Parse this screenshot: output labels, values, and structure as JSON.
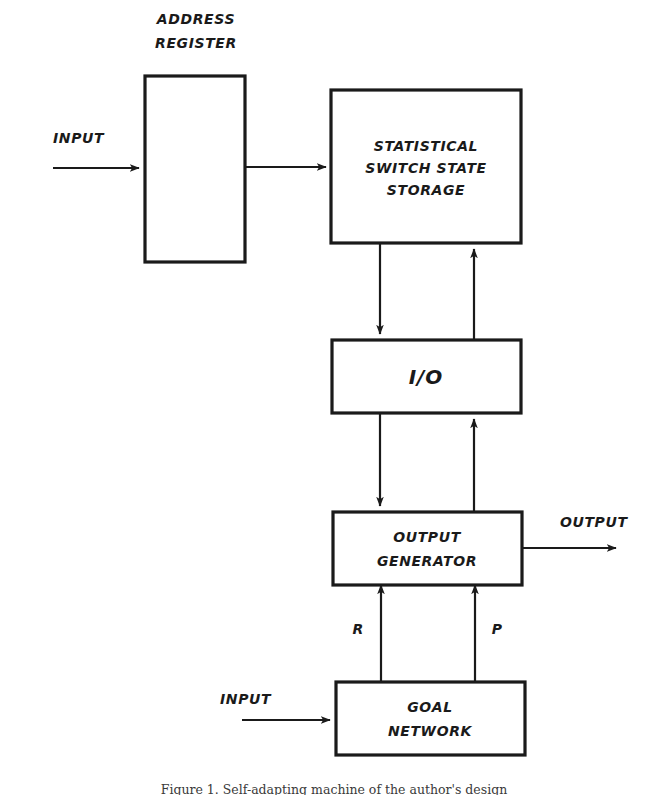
{
  "figure": {
    "type": "block-diagram",
    "background_color": "#ffffff",
    "line_color": "#1a1a1a",
    "caption": "Figure 1. Self-adapting machine of the author's design"
  },
  "nodes": {
    "address_register": {
      "label": "",
      "title_line1": "ADDRESS",
      "title_line2": "REGISTER",
      "x": 145,
      "y": 76,
      "w": 100,
      "h": 186
    },
    "statistical_storage": {
      "line1": "STATISTICAL",
      "line2": "SWITCH STATE",
      "line3": "STORAGE",
      "x": 331,
      "y": 90,
      "w": 190,
      "h": 153
    },
    "io": {
      "label": "I/O",
      "x": 332,
      "y": 340,
      "w": 189,
      "h": 73
    },
    "output_generator": {
      "line1": "OUTPUT",
      "line2": "GENERATOR",
      "x": 333,
      "y": 512,
      "w": 189,
      "h": 73
    },
    "goal_network": {
      "line1": "GOAL",
      "line2": "NETWORK",
      "x": 336,
      "y": 682,
      "w": 189,
      "h": 73
    }
  },
  "labels": {
    "input_top": "INPUT",
    "input_bottom": "INPUT",
    "output_right": "OUTPUT",
    "signal_r": "R",
    "signal_p": "P"
  },
  "edges": [
    {
      "name": "input-to-address-register",
      "from": "INPUT",
      "to": "ADDRESS REGISTER",
      "direction": "right"
    },
    {
      "name": "address-register-to-storage",
      "from": "ADDRESS REGISTER",
      "to": "STATISTICAL SWITCH STATE STORAGE",
      "direction": "right"
    },
    {
      "name": "storage-to-io",
      "from": "STATISTICAL SWITCH STATE STORAGE",
      "to": "I/O",
      "direction": "down"
    },
    {
      "name": "io-to-storage",
      "from": "I/O",
      "to": "STATISTICAL SWITCH STATE STORAGE",
      "direction": "up"
    },
    {
      "name": "io-to-output-generator",
      "from": "I/O",
      "to": "OUTPUT GENERATOR",
      "direction": "down"
    },
    {
      "name": "output-generator-to-io",
      "from": "OUTPUT GENERATOR",
      "to": "I/O",
      "direction": "up"
    },
    {
      "name": "output-generator-to-output",
      "from": "OUTPUT GENERATOR",
      "to": "OUTPUT",
      "direction": "right"
    },
    {
      "name": "goal-network-r-to-output-generator",
      "from": "GOAL NETWORK",
      "to": "OUTPUT GENERATOR",
      "direction": "up",
      "label": "R"
    },
    {
      "name": "goal-network-p-to-output-generator",
      "from": "GOAL NETWORK",
      "to": "OUTPUT GENERATOR",
      "direction": "up",
      "label": "P"
    },
    {
      "name": "input-to-goal-network",
      "from": "INPUT",
      "to": "GOAL NETWORK",
      "direction": "right"
    }
  ]
}
